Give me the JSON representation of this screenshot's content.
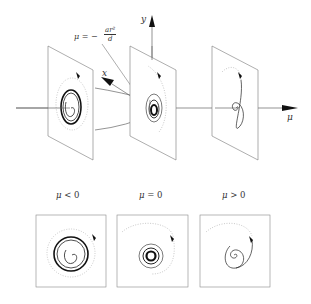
{
  "figure": {
    "type": "hopf-bifurcation-diagram",
    "axes": {
      "x_label": "x",
      "y_label": "y",
      "mu_label": "μ"
    },
    "paraboloid_annotation": {
      "lhs": "μ = −",
      "numerator": "ar²",
      "denominator": "d"
    },
    "cases": [
      {
        "id": "neg",
        "label_symbol": "μ",
        "label_rel": " < 0",
        "behavior": "stable limit cycle, spiral approaching cycle"
      },
      {
        "id": "zero",
        "label_symbol": "μ",
        "label_rel": " = 0",
        "behavior": "weakly stable focus, tight spiral"
      },
      {
        "id": "pos",
        "label_symbol": "μ",
        "label_rel": " > 0",
        "behavior": "unstable focus, outward spiral"
      }
    ],
    "colors": {
      "line": "#555555",
      "ink": "#111111",
      "dotted": "#aaaaaa"
    }
  }
}
